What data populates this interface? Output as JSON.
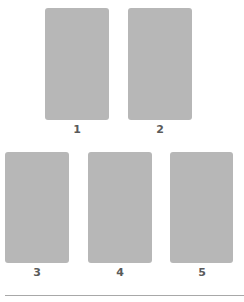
{
  "cards": [
    {
      "label": "1"
    },
    {
      "label": "2"
    },
    {
      "label": "3"
    },
    {
      "label": "4"
    },
    {
      "label": "5"
    }
  ],
  "colors": {
    "card": "#b7b7b7",
    "label": "#5a5a5a",
    "divider": "#a8a8a8"
  }
}
